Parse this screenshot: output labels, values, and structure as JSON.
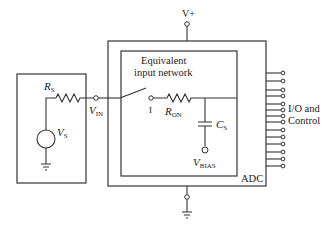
{
  "diagram": {
    "type": "circuit-schematic",
    "labels": {
      "supply": "V+",
      "source_resistor_main": "R",
      "source_resistor_sub": "S",
      "source_voltage_main": "V",
      "source_voltage_sub": "S",
      "input_node_main": "V",
      "input_node_sub": "IN",
      "network_title_line1": "Equivalent",
      "network_title_line2": "input network",
      "switch_mark": "I",
      "on_resistor_main": "R",
      "on_resistor_sub": "ON",
      "sample_cap_main": "C",
      "sample_cap_sub": "S",
      "bias_main": "V",
      "bias_sub": "BIAS",
      "io_line1": "I/O and",
      "io_line2": "Control",
      "adc": "ADC"
    },
    "io_pin_count": 14,
    "colors": {
      "line": "#333333",
      "text": "#222222",
      "background": "#ffffff"
    }
  }
}
